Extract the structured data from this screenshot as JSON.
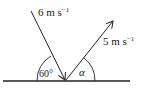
{
  "diagram": {
    "incoming": {
      "speed_label": "6 m s",
      "exponent": "−1"
    },
    "outgoing": {
      "speed_label": "5 m s",
      "exponent": "−1"
    },
    "angle_incoming": "60°",
    "angle_outgoing": "α",
    "colors": {
      "stroke": "#222222",
      "background": "#ffffff"
    }
  }
}
